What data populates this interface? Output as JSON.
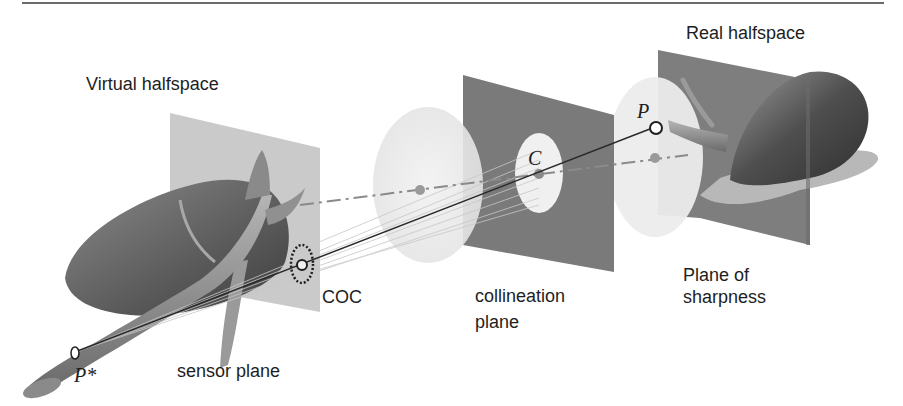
{
  "figure": {
    "type": "optical-geometry-diagram",
    "labels": {
      "virtual_halfspace": "Virtual halfspace",
      "real_halfspace": "Real halfspace",
      "coc": "COC",
      "collineation_plane_line1": "collineation",
      "collineation_plane_line2": "plane",
      "plane_of_sharpness_line1": "Plane of",
      "plane_of_sharpness_line2": "sharpness",
      "sensor_plane": "sensor plane"
    },
    "points": {
      "object_point": "P",
      "image_point": "P*",
      "center": "C"
    },
    "colors": {
      "background": "#ffffff",
      "text": "#1e1e1e",
      "top_rule": "#6b6b6b",
      "sensor_plane": "#c4c4c4",
      "collineation_plane": "#7a7a7a",
      "sharpness_plane": "#7e7e7e",
      "object_dark": "#4a4a4a",
      "cone_light": "#ebebeb",
      "ray_line": "#2a2a2a",
      "dash_dot_axis": "#8a8a8a"
    }
  }
}
